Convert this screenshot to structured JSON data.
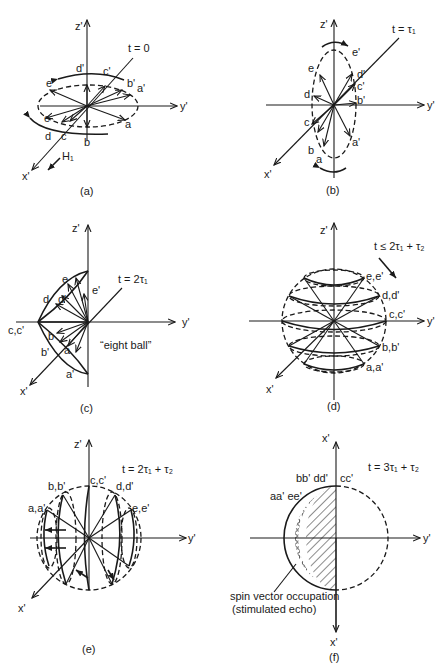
{
  "panels": {
    "a": {
      "caption": "(a)",
      "time": "t = 0",
      "axes": {
        "z": "z'",
        "y": "y'",
        "x": "x'"
      },
      "field": "H₁",
      "labels": {
        "a": "a",
        "b": "b",
        "c": "c",
        "d": "d",
        "e": "e",
        "a_p": "a'",
        "b_p": "b'",
        "c_p": "c'",
        "d_p": "d'",
        "e_p": "e'"
      }
    },
    "b": {
      "caption": "(b)",
      "time": "t = τ₁",
      "axes": {
        "z": "z'",
        "y": "y'",
        "x": "x'"
      },
      "labels": {
        "a": "a",
        "b": "b",
        "c": "c",
        "d": "d",
        "e": "e",
        "a_p": "a'",
        "b_p": "b'",
        "c_p": "c'",
        "d_p": "d'",
        "e_p": "e'"
      }
    },
    "c": {
      "caption": "(c)",
      "time": "t = 2τ₁",
      "axes": {
        "z": "z'",
        "y": "y'",
        "x": "x'"
      },
      "note": "“eight ball”",
      "labels": {
        "a": "a",
        "b": "b",
        "cc": "c,c'",
        "d": "d",
        "e": "e",
        "a_p": "a'",
        "b_p": "b'",
        "d_p": "d'",
        "e_p": "e'"
      }
    },
    "d": {
      "caption": "(d)",
      "time": "t ≤ 2τ₁ + τ₂",
      "axes": {
        "z": "z'",
        "y": "y'",
        "x": "x'"
      },
      "labels": {
        "ee": "e,e'",
        "dd": "d,d'",
        "cc": "c,c'",
        "bb": "b,b'",
        "aa": "a,a'"
      }
    },
    "e": {
      "caption": "(e)",
      "time": "t = 2τ₁ + τ₂",
      "axes": {
        "z": "z'",
        "y": "y'",
        "x": "x'"
      },
      "labels": {
        "aa": "a,a'",
        "bb": "b,b'",
        "cc": "c,c'",
        "dd": "d,d'",
        "ee": "e,e'"
      }
    },
    "f": {
      "caption": "(f)",
      "time": "t = 3τ₁ + τ₂",
      "axes": {
        "top": "x'",
        "y": "y'",
        "bottom": "x'"
      },
      "labels": {
        "bbdd": "bb' dd'",
        "cc": "cc'",
        "aaee": "aa' ee'"
      },
      "annotation": [
        "spin vector occupation",
        "(stimulated echo)"
      ]
    }
  }
}
